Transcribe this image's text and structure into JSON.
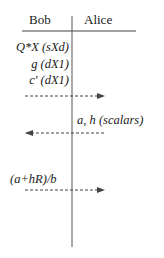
{
  "diagram": {
    "type": "sequence-protocol",
    "parties": [
      {
        "name": "Bob",
        "side": "left"
      },
      {
        "name": "Alice",
        "side": "right"
      }
    ],
    "bob_local_values": [
      {
        "label": "Q*X (sXd)"
      },
      {
        "label": "g (dX1)"
      },
      {
        "label": "c' (dX1)"
      }
    ],
    "messages": [
      {
        "from": "Bob",
        "to": "Alice",
        "label": "",
        "style": "dashed"
      },
      {
        "from": "Alice",
        "to": "Bob",
        "label": "a, h (scalars)",
        "style": "dashed"
      },
      {
        "from": "Bob",
        "to": "Alice",
        "label": "(a+hR)/b",
        "style": "dashed"
      }
    ],
    "colors": {
      "line": "#444444",
      "text": "#1a1a1a",
      "background": "#ffffff"
    }
  }
}
